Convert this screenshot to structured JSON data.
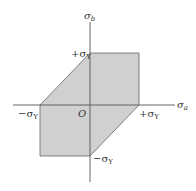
{
  "diagram": {
    "type": "yield-locus",
    "axes": {
      "horizontal_label": "σ",
      "horizontal_sub": "a",
      "vertical_label": "σ",
      "vertical_sub": "b",
      "origin_label": "O"
    },
    "tick_labels": {
      "pos_vertical": "+σ",
      "neg_vertical": "−σ",
      "pos_horizontal": "+σ",
      "neg_horizontal": "−σ",
      "sub": "Y"
    },
    "region": {
      "shape": "hexagon",
      "vertices": [
        [
          1,
          0
        ],
        [
          1,
          1
        ],
        [
          0,
          1
        ],
        [
          -1,
          0
        ],
        [
          -1,
          -1
        ],
        [
          0,
          -1
        ]
      ],
      "fill_color": "#d0d0d0",
      "stroke_color": "#555555"
    },
    "axis_color": "#555555"
  }
}
